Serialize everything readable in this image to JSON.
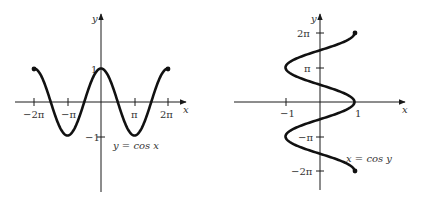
{
  "chart_data": [
    {
      "type": "line",
      "title": "y = cos x",
      "annotation": "y = cos x",
      "xlabel": "x",
      "ylabel": "y",
      "function": "y = cos(x)",
      "domain": [
        -6.2832,
        6.2832
      ],
      "xlim": [
        -6.2832,
        6.2832
      ],
      "ylim": [
        -1,
        1
      ],
      "x_tick_labels": [
        "−2π",
        "−π",
        "π",
        "2π"
      ],
      "x_tick_values": [
        -6.2832,
        -3.1416,
        3.1416,
        6.2832
      ],
      "y_tick_labels": [
        "1",
        "−1"
      ],
      "y_tick_values": [
        1,
        -1
      ],
      "endpoints": [
        [
          -6.2832,
          1
        ],
        [
          6.2832,
          1
        ]
      ],
      "grid": false
    },
    {
      "type": "line",
      "title": "x = cos y",
      "annotation": "x = cos y",
      "xlabel": "x",
      "ylabel": "y",
      "function": "x = cos(y)",
      "domain": [
        -6.2832,
        6.2832
      ],
      "xlim": [
        -1,
        1
      ],
      "ylim": [
        -6.2832,
        6.2832
      ],
      "x_tick_labels": [
        "−1",
        "1"
      ],
      "x_tick_values": [
        -1,
        1
      ],
      "y_tick_labels": [
        "2π",
        "π",
        "−π",
        "−2π"
      ],
      "y_tick_values": [
        6.2832,
        3.1416,
        -3.1416,
        -6.2832
      ],
      "endpoints": [
        [
          1,
          6.2832
        ],
        [
          1,
          -6.2832
        ]
      ],
      "grid": false
    }
  ],
  "left": {
    "xlabel": "x",
    "ylabel": "y",
    "annotation": "y = cos x",
    "ticks": {
      "neg2pi": "−2π",
      "negpi": "−π",
      "pi": "π",
      "twopi": "2π",
      "one": "1",
      "negone": "−1"
    }
  },
  "right": {
    "xlabel": "x",
    "ylabel": "y",
    "annotation": "x = cos y",
    "ticks": {
      "twopi": "2π",
      "pi": "π",
      "negpi": "−π",
      "neg2pi": "−2π",
      "negone": "−1",
      "one": "1"
    }
  },
  "colors": {
    "curve": "#111111",
    "axis": "#1a1a1a",
    "text": "#333333"
  }
}
